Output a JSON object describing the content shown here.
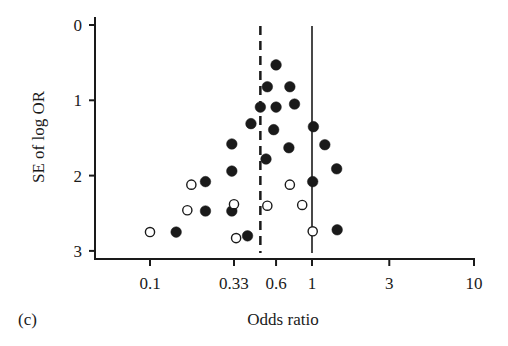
{
  "chart_data": {
    "type": "scatter",
    "title": "",
    "panel_label": "(c)",
    "xlabel": "Odds ratio",
    "ylabel": "SE of log OR",
    "xscale": "log",
    "xlim": [
      0.06,
      10
    ],
    "ylim": [
      3,
      0
    ],
    "y_inverted": true,
    "grid": false,
    "legend": null,
    "x_ticks": [
      {
        "value": 0.1,
        "label": "0.1"
      },
      {
        "value": 0.33,
        "label": "0.33"
      },
      {
        "value": 0.6,
        "label": "0.6"
      },
      {
        "value": 1,
        "label": "1"
      },
      {
        "value": 3,
        "label": "3"
      },
      {
        "value": 10,
        "label": "10"
      }
    ],
    "y_ticks": [
      {
        "value": 0,
        "label": "0"
      },
      {
        "value": 1,
        "label": "1"
      },
      {
        "value": 2,
        "label": "2"
      },
      {
        "value": 3,
        "label": "3"
      }
    ],
    "reference_lines": [
      {
        "name": "pooled-estimate",
        "x": 0.48,
        "style": "dashed"
      },
      {
        "name": "null-effect",
        "x": 1,
        "style": "solid"
      }
    ],
    "series": [
      {
        "name": "observed studies",
        "marker": "filled-circle",
        "points": [
          {
            "or": 0.6,
            "se": 0.53
          },
          {
            "or": 0.53,
            "se": 0.82
          },
          {
            "or": 0.73,
            "se": 0.82
          },
          {
            "or": 0.48,
            "se": 1.09
          },
          {
            "or": 0.6,
            "se": 1.09
          },
          {
            "or": 0.78,
            "se": 1.05
          },
          {
            "or": 0.42,
            "se": 1.31
          },
          {
            "or": 0.58,
            "se": 1.39
          },
          {
            "or": 1.02,
            "se": 1.35
          },
          {
            "or": 0.32,
            "se": 1.58
          },
          {
            "or": 0.72,
            "se": 1.63
          },
          {
            "or": 1.2,
            "se": 1.59
          },
          {
            "or": 0.32,
            "se": 1.94
          },
          {
            "or": 0.52,
            "se": 1.78
          },
          {
            "or": 1.42,
            "se": 1.91
          },
          {
            "or": 1.01,
            "se": 2.08
          },
          {
            "or": 0.22,
            "se": 2.08
          },
          {
            "or": 0.32,
            "se": 2.47
          },
          {
            "or": 0.22,
            "se": 2.47
          },
          {
            "or": 0.145,
            "se": 2.75
          },
          {
            "or": 0.4,
            "se": 2.8
          },
          {
            "or": 1.43,
            "se": 2.72
          }
        ]
      },
      {
        "name": "imputed (missing) studies",
        "marker": "open-circle",
        "points": [
          {
            "or": 0.18,
            "se": 2.12
          },
          {
            "or": 0.73,
            "se": 2.12
          },
          {
            "or": 0.17,
            "se": 2.46
          },
          {
            "or": 0.33,
            "se": 2.38
          },
          {
            "or": 0.53,
            "se": 2.4
          },
          {
            "or": 0.87,
            "se": 2.39
          },
          {
            "or": 0.1,
            "se": 2.75
          },
          {
            "or": 0.34,
            "se": 2.83
          },
          {
            "or": 1.01,
            "se": 2.74
          }
        ]
      }
    ]
  },
  "layout": {
    "plot_px": {
      "x_axis_y": 259,
      "y_axis_x": 95,
      "y_axis_top": 17,
      "x_axis_right": 474,
      "x_log_origin_px": 150,
      "x_log_origin_val": 0.1,
      "px_per_decade": 162,
      "y0_px": 25,
      "px_per_unit": 75.3
    },
    "colors": {
      "ink": "#1a1a1a",
      "background": "#ffffff"
    }
  }
}
